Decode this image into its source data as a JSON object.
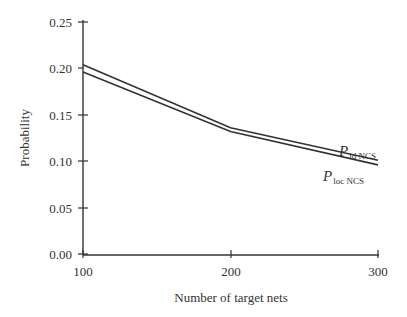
{
  "chart_data": {
    "type": "line",
    "title": "",
    "xlabel": "Number of target nets",
    "ylabel": "Probability",
    "x": [
      100,
      200,
      300
    ],
    "xticks": [
      "100",
      "200",
      "300"
    ],
    "yticks": [
      "0.00",
      "0.05",
      "0.10",
      "0.15",
      "0.20",
      "0.25"
    ],
    "xlim": [
      100,
      300
    ],
    "ylim": [
      0,
      0.25
    ],
    "grid": false,
    "legend_position": "inline labels at right end of lines",
    "series": [
      {
        "name": "P_id NCS",
        "label_main": "P",
        "label_sub": "id NCS",
        "values": [
          0.204,
          0.136,
          0.101
        ]
      },
      {
        "name": "P_loc NCS",
        "label_main": "P",
        "label_sub": "loc NCS",
        "values": [
          0.196,
          0.132,
          0.096
        ]
      }
    ]
  }
}
